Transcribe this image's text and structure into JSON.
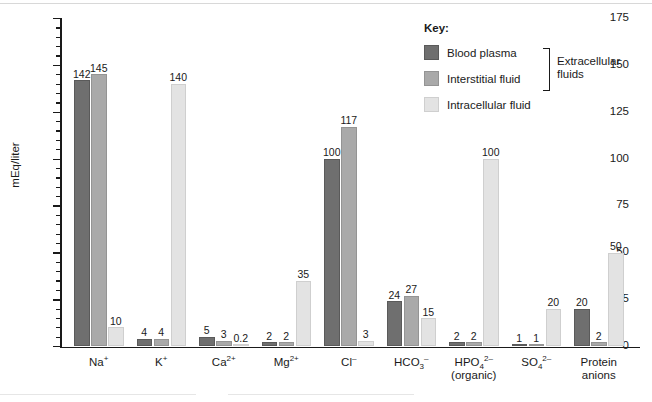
{
  "chart_data": {
    "type": "bar",
    "title": "",
    "xlabel": "",
    "ylabel": "mEq/liter",
    "ylim": [
      0,
      175
    ],
    "ytick_step": 25,
    "yminor_step": 5,
    "grid": false,
    "legend_position": "top-right",
    "yticks": [
      0,
      25,
      50,
      75,
      100,
      125,
      150,
      175
    ],
    "categories": [
      "Na+",
      "K+",
      "Ca2+",
      "Mg2+",
      "Cl-",
      "HCO3-",
      "HPO4 2- (organic)",
      "SO4 2-",
      "Protein anions"
    ],
    "series": [
      {
        "name": "Blood plasma",
        "color": "#6f6f6f",
        "values": [
          142,
          4,
          5,
          2,
          100,
          24,
          2,
          1,
          20
        ]
      },
      {
        "name": "Interstitial fluid",
        "color": "#a9a9a9",
        "values": [
          145,
          4,
          3,
          2,
          117,
          27,
          2,
          1,
          2
        ]
      },
      {
        "name": "Intracellular fluid",
        "color": "#e3e3e3",
        "values": [
          10,
          140,
          0.2,
          35,
          3,
          15,
          100,
          20,
          50
        ]
      }
    ],
    "value_labels": [
      [
        "142",
        "145",
        "10"
      ],
      [
        "4",
        "4",
        "140"
      ],
      [
        "5",
        "3",
        "0.2"
      ],
      [
        "2",
        "2",
        "35"
      ],
      [
        "100",
        "117",
        "3"
      ],
      [
        "24",
        "27",
        "15"
      ],
      [
        "2",
        "2",
        "100"
      ],
      [
        "1",
        "1",
        "20"
      ],
      [
        "20",
        "2",
        "50"
      ]
    ]
  },
  "axis": {
    "y_title": "mEq/liter",
    "tick_labels": [
      "175",
      "150",
      "125",
      "100",
      "75",
      "50",
      "25",
      "0"
    ]
  },
  "categories_display": [
    {
      "base": "Na",
      "sup": "+",
      "sub": "",
      "line2": ""
    },
    {
      "base": "K",
      "sup": "+",
      "sub": "",
      "line2": ""
    },
    {
      "base": "Ca",
      "sup": "2+",
      "sub": "",
      "line2": ""
    },
    {
      "base": "Mg",
      "sup": "2+",
      "sub": "",
      "line2": ""
    },
    {
      "base": "Cl",
      "sup": "–",
      "sub": "",
      "line2": ""
    },
    {
      "base": "HCO",
      "sup": "–",
      "sub": "3",
      "line2": ""
    },
    {
      "base": "HPO",
      "sup": "2–",
      "sub": "4",
      "line2": "(organic)"
    },
    {
      "base": "SO",
      "sup": "2–",
      "sub": "4",
      "line2": ""
    },
    {
      "base": "Protein",
      "sup": "",
      "sub": "",
      "line2": "anions"
    }
  ],
  "legend": {
    "title": "Key:",
    "items": [
      {
        "label": "Blood plasma",
        "color": "#6f6f6f"
      },
      {
        "label": "Interstitial fluid",
        "color": "#a9a9a9"
      },
      {
        "label": "Intracellular fluid",
        "color": "#e3e3e3"
      }
    ],
    "bracket_label_line1": "Extracellular",
    "bracket_label_line2": "fluids"
  }
}
